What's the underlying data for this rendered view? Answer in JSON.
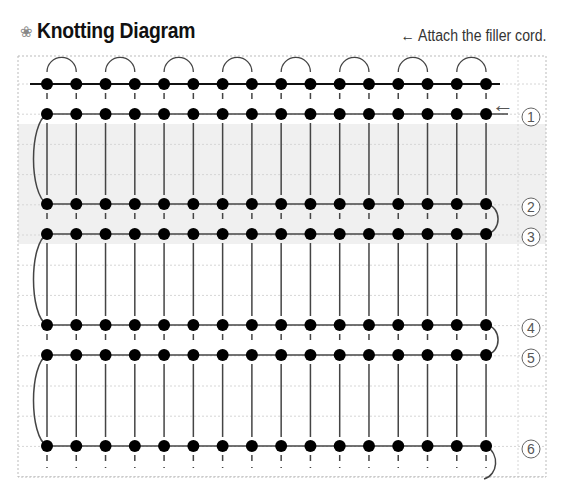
{
  "header": {
    "icon": "flower-icon",
    "icon_glyph": "❀",
    "title": "Knotting Diagram",
    "note": "← Attach the filler cord."
  },
  "diagram": {
    "columns": 16,
    "column_x_start": 47,
    "column_spacing": 29.27,
    "top_cord_y": 84,
    "rows": [
      {
        "label": "①",
        "y": 114
      },
      {
        "label": "②",
        "y": 204
      },
      {
        "label": "③",
        "y": 234
      },
      {
        "label": "④",
        "y": 325
      },
      {
        "label": "⑤",
        "y": 355
      },
      {
        "label": "⑥",
        "y": 446
      }
    ],
    "arrow_label": "←",
    "colors": {
      "dot": "#000000",
      "cord": "#444444",
      "grid": "#bbbbbb",
      "shade": "#f0f0f0"
    }
  },
  "footer": {
    "text": "Knotting Tutorial"
  }
}
